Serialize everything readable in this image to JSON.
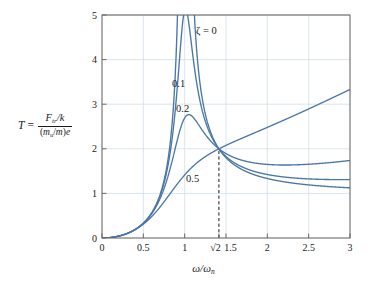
{
  "chart_data": {
    "type": "line",
    "title": "",
    "xlabel": "ω/ωₙ",
    "ylabel": "T = (F_tr/k) / ((m_u/m)e)",
    "xlim": [
      0,
      3
    ],
    "ylim": [
      0,
      5
    ],
    "grid": true,
    "legend_position": "inline-curve-labels",
    "xticks": [
      0,
      0.5,
      1,
      1.4142,
      1.5,
      2,
      2.5,
      3
    ],
    "xticklabels": [
      "0",
      "0.5",
      "1",
      "√2",
      "1.5",
      "2",
      "2.5",
      "3"
    ],
    "yticks": [
      0,
      1,
      2,
      3,
      4,
      5
    ],
    "yticklabels": [
      "0",
      "1",
      "2",
      "3",
      "4",
      "5"
    ],
    "annotations": [
      {
        "text": "ζ = 0",
        "x": 1.62,
        "y": 4.62
      },
      {
        "text": "0.1",
        "x": 1.02,
        "y": 3.42
      },
      {
        "text": "0.2",
        "x": 1.07,
        "y": 2.88
      },
      {
        "text": "0.5",
        "x": 1.22,
        "y": 1.36
      }
    ],
    "reference_line": {
      "x": 1.4142,
      "label": "√2",
      "style": "dashed",
      "from_y": 0,
      "to_y": 2
    },
    "crossing_point": {
      "x": 1.4142,
      "y": 2
    },
    "series": [
      {
        "name": "ζ = 0",
        "zeta": 0,
        "x": [
          0,
          0.1,
          0.2,
          0.3,
          0.4,
          0.5,
          0.6,
          0.7,
          0.8,
          0.85,
          0.9,
          0.92,
          0.94,
          0.95,
          1.05,
          1.06,
          1.08,
          1.1,
          1.15,
          1.2,
          1.3,
          1.4142,
          1.5,
          1.6,
          1.8,
          2.0,
          2.2,
          2.5,
          2.75,
          3.0
        ],
        "y": [
          0,
          0.01,
          0.042,
          0.099,
          0.19,
          0.333,
          0.563,
          0.96,
          1.78,
          2.48,
          3.74,
          4.64,
          6.23,
          7.42,
          6.57,
          5.7,
          4.45,
          3.66,
          2.81,
          2.46,
          2.14,
          2.0,
          1.99,
          2.02,
          2.2,
          2.4,
          2.6,
          2.88,
          3.1,
          3.3
        ]
      },
      {
        "name": "ζ = 0.1",
        "zeta": 0.1,
        "x": [
          0,
          0.1,
          0.2,
          0.3,
          0.4,
          0.5,
          0.6,
          0.7,
          0.8,
          0.85,
          0.9,
          0.95,
          0.98,
          1.0,
          1.02,
          1.05,
          1.1,
          1.15,
          1.2,
          1.3,
          1.4142,
          1.5,
          1.6,
          1.8,
          2.0,
          2.2,
          2.5,
          2.75,
          3.0
        ],
        "y": [
          0,
          0.01,
          0.042,
          0.099,
          0.19,
          0.332,
          0.558,
          0.94,
          1.69,
          2.28,
          3.19,
          4.36,
          4.92,
          5.03,
          4.88,
          4.33,
          3.23,
          2.62,
          2.33,
          2.07,
          2.0,
          1.93,
          1.82,
          1.6,
          1.43,
          1.33,
          1.21,
          1.15,
          1.1
        ]
      },
      {
        "name": "ζ = 0.2",
        "zeta": 0.2,
        "x": [
          0,
          0.1,
          0.2,
          0.3,
          0.4,
          0.5,
          0.6,
          0.7,
          0.8,
          0.85,
          0.9,
          0.95,
          1.0,
          1.05,
          1.1,
          1.15,
          1.2,
          1.3,
          1.4142,
          1.5,
          1.6,
          1.8,
          2.0,
          2.2,
          2.5,
          2.75,
          3.0
        ],
        "y": [
          0,
          0.01,
          0.042,
          0.098,
          0.188,
          0.326,
          0.538,
          0.875,
          1.45,
          1.83,
          2.25,
          2.6,
          2.74,
          2.64,
          2.42,
          2.2,
          2.05,
          2.0,
          2.0,
          1.97,
          1.9,
          1.74,
          1.6,
          1.5,
          1.4,
          1.33,
          1.27
        ]
      },
      {
        "name": "ζ = 0.5",
        "zeta": 0.5,
        "x": [
          0,
          0.1,
          0.2,
          0.3,
          0.4,
          0.5,
          0.6,
          0.7,
          0.8,
          0.9,
          1.0,
          1.1,
          1.2,
          1.3,
          1.4142,
          1.5,
          1.6,
          1.8,
          2.0,
          2.2,
          2.4,
          2.6,
          2.8,
          3.0
        ],
        "y": [
          0,
          0.01,
          0.041,
          0.096,
          0.18,
          0.3,
          0.46,
          0.67,
          0.92,
          1.2,
          1.45,
          1.64,
          1.79,
          1.91,
          2.0,
          2.0,
          1.98,
          1.87,
          1.76,
          1.69,
          1.65,
          1.64,
          1.66,
          1.71
        ]
      }
    ],
    "colors": {
      "curve": "#4a77a8",
      "grid": "#d6e2ec",
      "axis": "#6b6b6b",
      "text": "#1a1a1a",
      "dashed": "#1a1a1a"
    }
  },
  "axis_label": {
    "y_lead": "T",
    "y_equals": "=",
    "y_num_F": "F",
    "y_num_F_sub": "tr",
    "y_num_slash_k": "/k",
    "y_den_open": "(",
    "y_den_m": "m",
    "y_den_m_sub": "u",
    "y_den_slash": "/",
    "y_den_m2": "m",
    "y_den_close": ")",
    "y_den_e": "e",
    "x_omega": "ω/ω",
    "x_omega_sub": "n"
  },
  "curve_labels": {
    "zeta_zero": "ζ = 0",
    "d01": "0.1",
    "d02": "0.2",
    "d05": "0.5"
  },
  "plot_box": {
    "left": 102,
    "top": 15,
    "right": 350,
    "bottom": 238
  }
}
